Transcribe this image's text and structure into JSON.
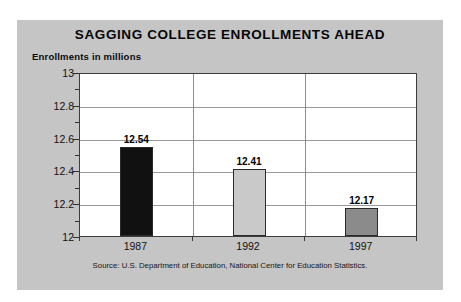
{
  "chart_data": {
    "type": "bar",
    "title": "SAGGING COLLEGE ENROLLMENTS AHEAD",
    "subtitle": "Enrollments in millions",
    "xlabel": "",
    "ylabel": "Enrollments in millions",
    "categories": [
      "1987",
      "1992",
      "1997"
    ],
    "values": [
      12.54,
      12.41,
      12.17
    ],
    "value_labels": [
      "12.54",
      "12.41",
      "12.17"
    ],
    "bar_colors": [
      "#111111",
      "#c9c9c9",
      "#8b8b8b"
    ],
    "ylim": [
      12,
      13
    ],
    "ytick_labels": [
      "13",
      "12.8",
      "12.6",
      "12.4",
      "12.2",
      "12"
    ],
    "ytick_values": [
      13,
      12.8,
      12.6,
      12.4,
      12.2,
      12
    ],
    "yminor_values": [
      12.9,
      12.7,
      12.5,
      12.3,
      12.1
    ],
    "grid": "horizontal-and-vertical",
    "legend": "none",
    "source": "Source: U.S. Department of Education, National Center for Education Statistics.",
    "panel_color": "#c5c5c5",
    "plot_background": "#ffffff",
    "gridline_color": "#9a9a9a"
  }
}
